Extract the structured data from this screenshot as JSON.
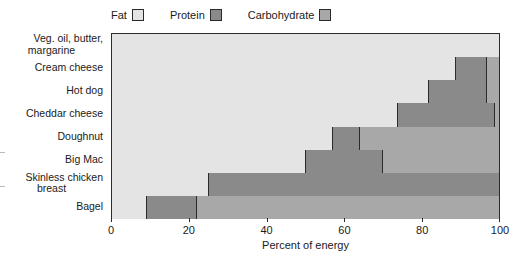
{
  "chart_data": {
    "type": "bar",
    "orientation": "horizontal",
    "stacked": true,
    "title": "",
    "xlabel": "Percent of energy",
    "ylabel": "",
    "xlim": [
      0,
      100
    ],
    "xticks": [
      0,
      20,
      40,
      60,
      80,
      100
    ],
    "xtick_labels": [
      "0",
      "20",
      "40",
      "60",
      "80",
      "100"
    ],
    "grid": false,
    "legend_position": "top",
    "categories": [
      "Veg. oil, butter, margarine",
      "Cream cheese",
      "Hot dog",
      "Cheddar cheese",
      "Doughnut",
      "Big Mac",
      "Skinless chicken breast",
      "Bagel"
    ],
    "series": [
      {
        "name": "Fat",
        "color": "#e4e4e4",
        "values": [
          100,
          89,
          82,
          74,
          57,
          50,
          25,
          9
        ]
      },
      {
        "name": "Protein",
        "color": "#8a8a8a",
        "values": [
          0,
          8,
          15,
          25,
          7,
          20,
          75,
          13
        ]
      },
      {
        "name": "Carbohydrate",
        "color": "#a8a8a8",
        "values": [
          0,
          3,
          3,
          1,
          36,
          30,
          0,
          78
        ]
      }
    ]
  },
  "legend": {
    "entries": [
      {
        "label": "Fat",
        "color": "#e4e4e4"
      },
      {
        "label": "Protein",
        "color": "#8a8a8a"
      },
      {
        "label": "Carbohydrate",
        "color": "#a8a8a8"
      }
    ]
  },
  "axis": {
    "x_title": "Percent of energy"
  },
  "category_labels": [
    {
      "line1": "Veg. oil, butter,",
      "line2": "margarine"
    },
    {
      "line1": "Cream cheese",
      "line2": ""
    },
    {
      "line1": "Hot dog",
      "line2": ""
    },
    {
      "line1": "Cheddar cheese",
      "line2": ""
    },
    {
      "line1": "Doughnut",
      "line2": ""
    },
    {
      "line1": "Big Mac",
      "line2": ""
    },
    {
      "line1": "Skinless chicken",
      "line2": "breast"
    },
    {
      "line1": "Bagel",
      "line2": ""
    }
  ],
  "colors": {
    "fat": "#e4e4e4",
    "protein": "#8a8a8a",
    "carbohydrate": "#a8a8a8",
    "outline": "#2b2b2b",
    "text": "#1a1a1a",
    "background": "#ffffff"
  }
}
